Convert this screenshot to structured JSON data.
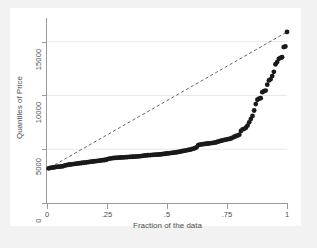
{
  "chart_data": {
    "type": "scatter",
    "title": "",
    "subtitle": "",
    "xlabel": "Fraction of the data",
    "ylabel": "Quantiles of Price",
    "xlim": [
      0,
      1
    ],
    "ylim": [
      0,
      17200
    ],
    "xticks": [
      0,
      0.25,
      0.5,
      0.75,
      1
    ],
    "xticklabels": [
      "0",
      ".25",
      ".5",
      ".75",
      "1"
    ],
    "yticks": [
      0,
      5000,
      10000,
      15000
    ],
    "yticklabels": [
      "0",
      "5000",
      "10000",
      "15000"
    ],
    "grid": "horizontal",
    "legend": "none",
    "marker_color": "#1a1a1a",
    "marker_shape": "circle",
    "marker_size_px": 2.4,
    "reference_line": {
      "name": "diagonal-reference-line",
      "style": "dashed",
      "color": "#3c3c50",
      "x": [
        0.012,
        1.0
      ],
      "y": [
        3291,
        15906
      ]
    },
    "series": [
      {
        "name": "Quantiles of Price",
        "x": [
          0.0068,
          0.0137,
          0.0205,
          0.0274,
          0.0342,
          0.0411,
          0.0479,
          0.0548,
          0.0616,
          0.0685,
          0.0753,
          0.0822,
          0.089,
          0.0959,
          0.1027,
          0.1096,
          0.1164,
          0.1233,
          0.1301,
          0.137,
          0.1438,
          0.1507,
          0.1575,
          0.1644,
          0.1712,
          0.1781,
          0.1849,
          0.1918,
          0.1986,
          0.2055,
          0.2123,
          0.2192,
          0.226,
          0.2329,
          0.2397,
          0.2466,
          0.2534,
          0.2603,
          0.2671,
          0.274,
          0.2808,
          0.2877,
          0.2945,
          0.3014,
          0.3082,
          0.3151,
          0.3219,
          0.3288,
          0.3356,
          0.3425,
          0.3493,
          0.3562,
          0.363,
          0.3699,
          0.3767,
          0.3836,
          0.3904,
          0.3973,
          0.4041,
          0.411,
          0.4178,
          0.4247,
          0.4315,
          0.4384,
          0.4452,
          0.4521,
          0.4589,
          0.4658,
          0.4726,
          0.4795,
          0.4863,
          0.4932,
          0.5,
          0.5068,
          0.5137,
          0.5205,
          0.5274,
          0.5342,
          0.5411,
          0.5479,
          0.5548,
          0.5616,
          0.5685,
          0.5753,
          0.5822,
          0.589,
          0.5959,
          0.6027,
          0.6096,
          0.6164,
          0.6233,
          0.6301,
          0.637,
          0.6438,
          0.6507,
          0.6575,
          0.6644,
          0.6712,
          0.6781,
          0.6849,
          0.6918,
          0.6986,
          0.7055,
          0.7123,
          0.7192,
          0.726,
          0.7329,
          0.7397,
          0.7466,
          0.7534,
          0.7603,
          0.7671,
          0.774,
          0.7808,
          0.7877,
          0.7945,
          0.8014,
          0.8082,
          0.8151,
          0.8219,
          0.8288,
          0.8356,
          0.8425,
          0.8493,
          0.8562,
          0.863,
          0.8699,
          0.8767,
          0.8836,
          0.8904,
          0.8973,
          0.9041,
          0.911,
          0.9178,
          0.9247,
          0.9315,
          0.9384,
          0.9452,
          0.9521,
          0.9589,
          0.9658,
          0.9726,
          0.9795,
          0.9863,
          0.9932,
          1.0
        ],
        "y": [
          3219,
          3270,
          3291,
          3299,
          3340,
          3360,
          3370,
          3385,
          3405,
          3430,
          3490,
          3530,
          3555,
          3580,
          3600,
          3620,
          3640,
          3660,
          3680,
          3700,
          3720,
          3740,
          3760,
          3780,
          3800,
          3820,
          3840,
          3860,
          3880,
          3900,
          3920,
          3940,
          3960,
          3980,
          4000,
          4020,
          4080,
          4120,
          4150,
          4170,
          4190,
          4200,
          4210,
          4220,
          4230,
          4240,
          4250,
          4260,
          4270,
          4280,
          4290,
          4300,
          4310,
          4320,
          4330,
          4340,
          4360,
          4380,
          4400,
          4420,
          4440,
          4450,
          4460,
          4470,
          4480,
          4490,
          4500,
          4510,
          4520,
          4540,
          4560,
          4580,
          4600,
          4620,
          4640,
          4660,
          4680,
          4700,
          4720,
          4750,
          4780,
          4810,
          4840,
          4870,
          4900,
          4930,
          4960,
          5000,
          5050,
          5100,
          5180,
          5380,
          5420,
          5450,
          5470,
          5490,
          5510,
          5530,
          5550,
          5570,
          5590,
          5610,
          5650,
          5700,
          5750,
          5790,
          5830,
          5870,
          5900,
          5930,
          5960,
          6000,
          6080,
          6160,
          6230,
          6270,
          6350,
          6700,
          6850,
          6900,
          7000,
          7200,
          7500,
          7800,
          8100,
          8600,
          9200,
          9600,
          9700,
          9750,
          10300,
          10400,
          10450,
          11000,
          11400,
          11500,
          11800,
          12200,
          12900,
          13100,
          13400,
          13500,
          13550,
          14500,
          14550,
          15906
        ],
        "marker": "filled-circle",
        "color": "#1a1a1a"
      }
    ]
  }
}
